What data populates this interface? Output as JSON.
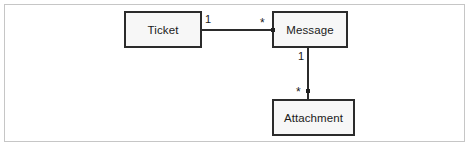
{
  "diagram": {
    "type": "uml-class-diagram",
    "classes": [
      {
        "id": "ticket",
        "name": "Ticket"
      },
      {
        "id": "message",
        "name": "Message"
      },
      {
        "id": "attachment",
        "name": "Attachment"
      }
    ],
    "associations": [
      {
        "id": "ticket-message",
        "from": "Ticket",
        "to": "Message",
        "orientation": "horizontal",
        "from_multiplicity": "1",
        "to_multiplicity": "*"
      },
      {
        "id": "message-attachment",
        "from": "Message",
        "to": "Attachment",
        "orientation": "vertical",
        "from_multiplicity": "1",
        "to_multiplicity": "*"
      }
    ],
    "multiplicities": {
      "ticket_side": "1",
      "message_side_from_ticket": "*",
      "message_side_to_attachment": "1",
      "attachment_side": "*"
    },
    "colors": {
      "class_border": "#2b2b2b",
      "class_fill": "#f7f7f7",
      "line": "#2b2b2b",
      "frame_border": "#c6c6c6",
      "text": "#1a1a1a",
      "background": "#ffffff"
    }
  }
}
